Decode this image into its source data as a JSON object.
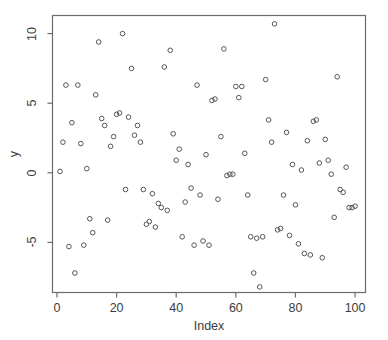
{
  "chart_data": {
    "type": "scatter",
    "title": "",
    "xlabel": "Index",
    "ylabel": "y",
    "xlim": [
      -1.5,
      103.5
    ],
    "ylim": [
      -8.6,
      11.3
    ],
    "xticks": [
      0,
      20,
      40,
      60,
      80,
      100
    ],
    "yticks": [
      -5,
      0,
      5,
      10
    ],
    "xtick_labels": [
      "0",
      "20",
      "40",
      "60",
      "80",
      "100"
    ],
    "ytick_labels": [
      "-5",
      "0",
      "5",
      "10"
    ],
    "grid": false,
    "legend": false,
    "marker": "open-circle",
    "marker_color": "#555555",
    "marker_size": 4.6,
    "frame_color": "#6b6b6b",
    "background": "#ffffff",
    "n_points": 100,
    "x": [
      1,
      2,
      3,
      4,
      5,
      6,
      7,
      8,
      9,
      10,
      11,
      12,
      13,
      14,
      15,
      16,
      17,
      18,
      19,
      20,
      21,
      22,
      23,
      24,
      25,
      26,
      27,
      28,
      29,
      30,
      31,
      32,
      33,
      34,
      35,
      36,
      37,
      38,
      39,
      40,
      41,
      42,
      43,
      44,
      45,
      46,
      47,
      48,
      49,
      50,
      51,
      52,
      53,
      54,
      55,
      56,
      57,
      58,
      59,
      60,
      61,
      62,
      63,
      64,
      65,
      66,
      67,
      68,
      69,
      70,
      71,
      72,
      73,
      74,
      75,
      76,
      77,
      78,
      79,
      80,
      81,
      82,
      83,
      84,
      85,
      86,
      87,
      88,
      89,
      90,
      91,
      92,
      93,
      94,
      95,
      96,
      97,
      98,
      99,
      100
    ],
    "y": [
      0.1,
      2.2,
      6.3,
      -5.3,
      3.6,
      -7.2,
      6.3,
      2.1,
      -5.2,
      0.3,
      -3.3,
      -4.3,
      5.6,
      9.4,
      3.9,
      3.4,
      -3.4,
      1.9,
      2.6,
      4.2,
      4.3,
      10.0,
      -1.2,
      4.0,
      7.5,
      2.7,
      3.4,
      2.2,
      -1.2,
      -3.7,
      -3.5,
      -1.5,
      -3.9,
      -2.2,
      -2.5,
      7.6,
      -2.7,
      8.8,
      2.8,
      0.9,
      1.7,
      -4.6,
      -2.1,
      0.6,
      -1.1,
      -5.2,
      6.3,
      -1.6,
      -4.9,
      1.3,
      -5.2,
      5.2,
      5.3,
      -1.9,
      2.6,
      8.9,
      -0.2,
      -0.1,
      -0.1,
      6.2,
      5.4,
      6.2,
      1.4,
      -1.6,
      -4.6,
      -7.2,
      -4.7,
      -8.2,
      -4.6,
      6.7,
      3.8,
      2.2,
      10.7,
      -4.1,
      -4.0,
      -1.6,
      2.9,
      -4.5,
      0.6,
      -2.3,
      -5.1,
      0.2,
      -5.8,
      2.3,
      -5.9,
      3.7,
      3.8,
      0.7,
      -6.1,
      2.4,
      0.9,
      -0.1,
      -3.2,
      6.9,
      -1.2,
      -1.4,
      0.4,
      -2.5,
      -2.5,
      -2.4
    ]
  },
  "axes": {
    "x_title": "Index",
    "y_title": "y"
  }
}
